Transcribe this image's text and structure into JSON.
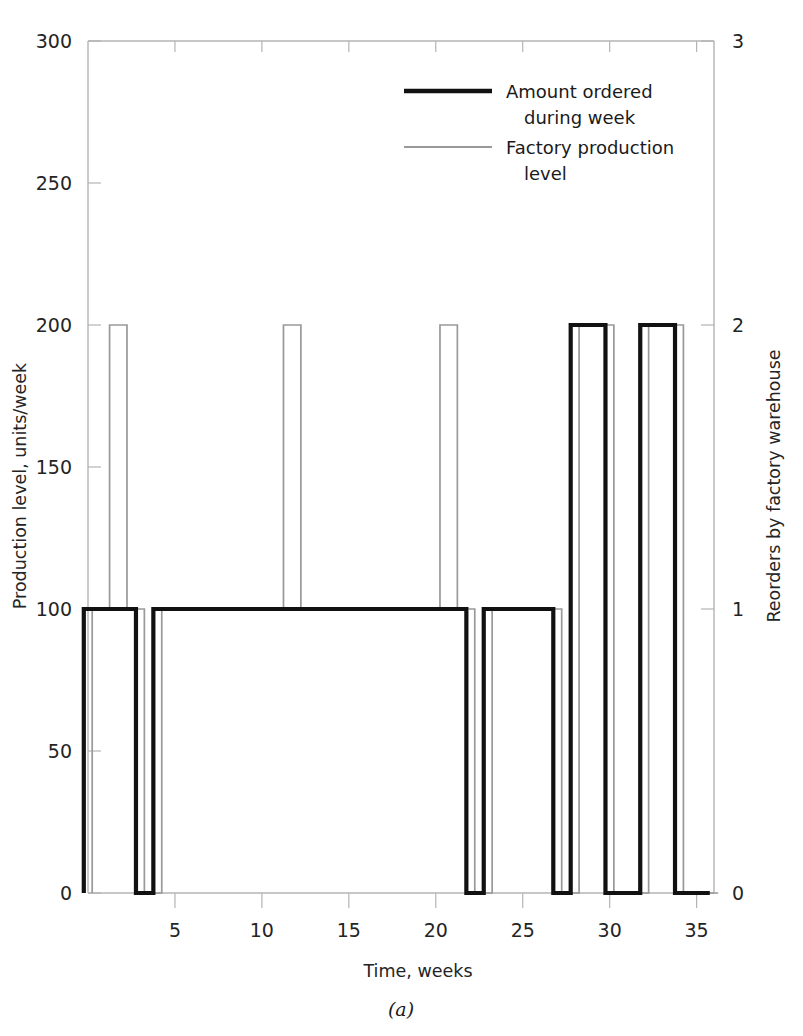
{
  "figure": {
    "caption": "(a)"
  },
  "chart_data": {
    "type": "bar",
    "title": "",
    "subtitle": "",
    "xlabel": "Time, weeks",
    "ylabel": "Production level, units/week",
    "y2label": "Reorders by factory warehouse",
    "xlim": [
      0,
      36
    ],
    "ylim": [
      0,
      300
    ],
    "y2lim": [
      0,
      3
    ],
    "grid": false,
    "legend_position": "top-center",
    "xticks": [
      5,
      10,
      15,
      20,
      25,
      30,
      35
    ],
    "xtick_labels": [
      "5",
      "10",
      "15",
      "20",
      "25",
      "30",
      "35"
    ],
    "yticks": [
      0,
      50,
      100,
      150,
      200,
      250,
      300
    ],
    "ytick_labels": [
      "0",
      "50",
      "100",
      "150",
      "200",
      "250",
      "300"
    ],
    "y2ticks": [
      0,
      1,
      2,
      3
    ],
    "y2tick_labels": [
      "0",
      "1",
      "2",
      "3"
    ],
    "x": [
      1,
      2,
      3,
      4,
      5,
      6,
      7,
      8,
      9,
      10,
      11,
      12,
      13,
      14,
      15,
      16,
      17,
      18,
      19,
      20,
      21,
      22,
      23,
      24,
      25,
      26,
      27,
      28,
      29,
      30,
      31,
      32,
      33,
      34,
      35,
      36
    ],
    "series": [
      {
        "name": "Amount ordered during week",
        "style": "thick-black-step",
        "color": "#111111",
        "axis": "left",
        "values": [
          100,
          100,
          100,
          0,
          100,
          100,
          100,
          100,
          100,
          100,
          100,
          100,
          100,
          100,
          100,
          100,
          100,
          100,
          100,
          100,
          100,
          100,
          0,
          100,
          100,
          100,
          100,
          0,
          200,
          200,
          0,
          0,
          200,
          200,
          0,
          0
        ]
      },
      {
        "name": "Factory production level",
        "style": "thin-gray-step",
        "color": "#999999",
        "axis": "left",
        "values": [
          100,
          200,
          100,
          0,
          100,
          100,
          100,
          100,
          100,
          100,
          100,
          200,
          100,
          100,
          100,
          100,
          100,
          100,
          100,
          100,
          200,
          100,
          0,
          100,
          100,
          100,
          100,
          0,
          200,
          200,
          0,
          0,
          200,
          200,
          0,
          0
        ]
      }
    ],
    "legend": [
      {
        "label_line1": "Amount ordered",
        "label_line2": "during week",
        "swatch": "thick-black"
      },
      {
        "label_line1": "Factory production",
        "label_line2": "level",
        "swatch": "thin-gray"
      }
    ],
    "colors": {
      "ordered": "#111111",
      "production": "#999999",
      "axis": "#b4b4b4",
      "text": "#242424",
      "background": "#ffffff"
    }
  }
}
